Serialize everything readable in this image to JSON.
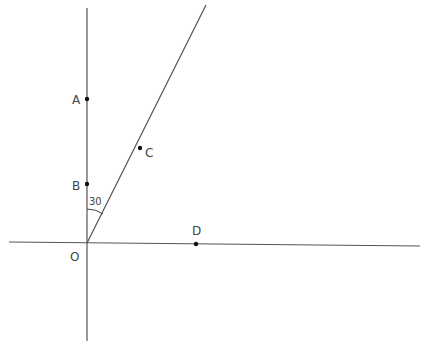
{
  "diagram": {
    "type": "geometry-angle-construction",
    "background": "#ffffff",
    "line_color": "#555555",
    "point_color": "#111111",
    "lines": [
      {
        "name": "vertical-axis",
        "x1": 87,
        "y1": 8,
        "x2": 87,
        "y2": 341
      },
      {
        "name": "horizontal-axis",
        "x1": 9,
        "y1": 242,
        "x2": 420,
        "y2": 246
      },
      {
        "name": "ray-OC",
        "x1": 87,
        "y1": 243,
        "x2": 206,
        "y2": 5
      }
    ],
    "points": [
      {
        "label": "A",
        "x": 87,
        "y": 99,
        "label_x": 72,
        "label_y": 104
      },
      {
        "label": "B",
        "x": 87,
        "y": 184,
        "label_x": 72,
        "label_y": 190
      },
      {
        "label": "C",
        "x": 140,
        "y": 148,
        "label_x": 145,
        "label_y": 157
      },
      {
        "label": "D",
        "x": 196,
        "y": 244,
        "label_x": 192,
        "label_y": 235
      },
      {
        "label": "O",
        "x": 87,
        "y": 243,
        "label_x": 70,
        "label_y": 261,
        "show_dot": false
      }
    ],
    "angle": {
      "value_label": "30",
      "label_x": 89,
      "label_y": 205,
      "arc_path": "M 87 209 Q 96 209 103 214"
    }
  }
}
